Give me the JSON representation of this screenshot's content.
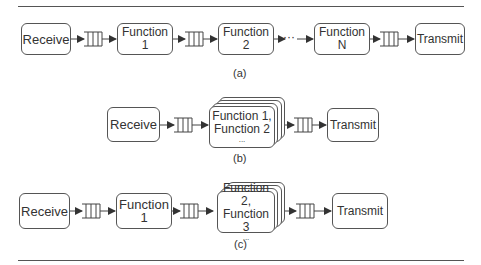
{
  "diagram_a": {
    "caption": "(a)",
    "nodes": [
      "Receive",
      "Function 1",
      "Function 2",
      "Function N",
      "Transmit"
    ],
    "ellipsis": "···"
  },
  "diagram_b": {
    "caption": "(b)",
    "nodes": [
      "Receive",
      "Function 1,\nFunction 2",
      "Transmit"
    ],
    "stack_line1": "Function 1,",
    "stack_line2": "Function 2",
    "stack_more": "..."
  },
  "diagram_c": {
    "caption": "(c)",
    "nodes": [
      "Receive",
      "Function 1",
      "Function 2,\nFunction 3",
      "Transmit"
    ],
    "stack_line1": "Function 2,",
    "stack_line2": "Function 3",
    "stack_more": "..."
  }
}
